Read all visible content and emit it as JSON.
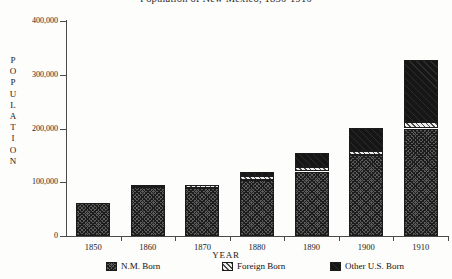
{
  "chart_data": {
    "type": "bar",
    "subtype": "stacked-vertical",
    "title": "Population of New Mexico, 1850-1910",
    "xlabel": "YEAR",
    "ylabel": "POPULATION",
    "categories": [
      "1850",
      "1860",
      "1870",
      "1880",
      "1890",
      "1900",
      "1910"
    ],
    "series": [
      {
        "name": "N.M. Born",
        "pattern": "dark-crosshatch",
        "color": "#4a4a4a",
        "values": [
          61000,
          91000,
          90000,
          104000,
          120000,
          150000,
          200000
        ]
      },
      {
        "name": "Foreign Born",
        "pattern": "light-diagonal-hatch",
        "color": "#ececea",
        "values": [
          0,
          4000,
          4000,
          7000,
          8000,
          8000,
          13000
        ]
      },
      {
        "name": "Other U.S. Born",
        "pattern": "solid-black",
        "color": "#161616",
        "values": [
          0,
          0,
          0,
          8000,
          27000,
          43000,
          114000
        ]
      }
    ],
    "totals": [
      61000,
      95000,
      94000,
      119000,
      155000,
      201000,
      327000
    ],
    "ylim": [
      0,
      400000
    ],
    "yticks": [
      0,
      100000,
      200000,
      300000,
      400000
    ],
    "ytick_labels": [
      "0",
      "100,000",
      "200,000",
      "300,000",
      "400,000"
    ],
    "grid": false,
    "legend_position": "bottom"
  },
  "axes": {
    "y_title_letters": [
      "P",
      "O",
      "P",
      "U",
      "L",
      "A",
      "T",
      "I",
      "O",
      "N"
    ],
    "x_title": "YEAR"
  },
  "legend": {
    "items": [
      {
        "label": "N.M. Born"
      },
      {
        "label": "Foreign Born"
      },
      {
        "label": "Other U.S. Born"
      }
    ]
  }
}
